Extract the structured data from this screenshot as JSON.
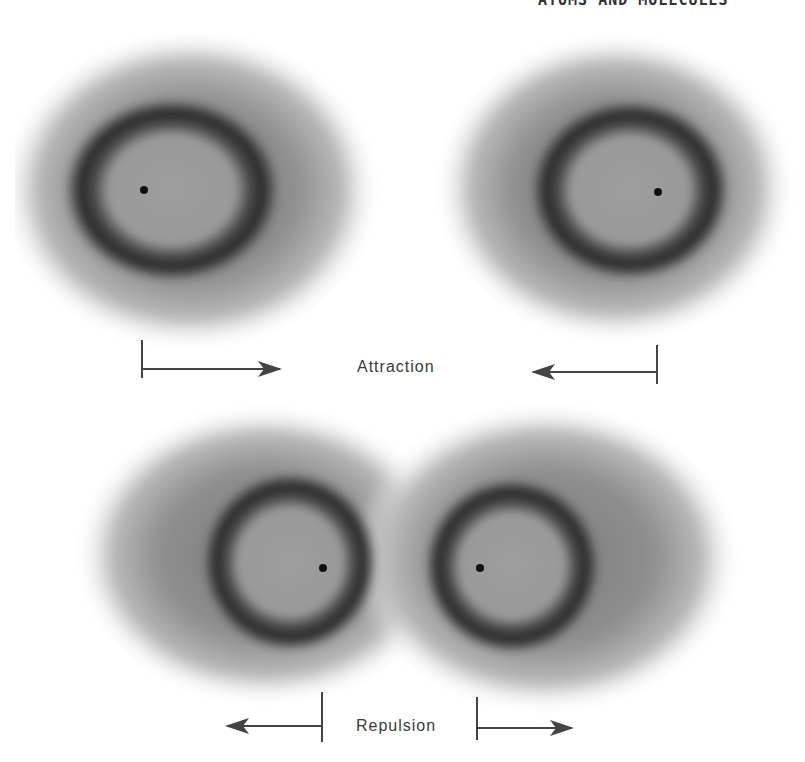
{
  "header": {
    "running_title": "ATOMS AND MOLECULES"
  },
  "panels": {
    "attraction": {
      "label": "Attraction",
      "atoms": [
        {
          "name": "left-atom",
          "ring_center": [
            172,
            190
          ],
          "nucleus": [
            144,
            190
          ]
        },
        {
          "name": "right-atom",
          "ring_center": [
            630,
            190
          ],
          "nucleus": [
            658,
            192
          ]
        }
      ],
      "arrows": [
        {
          "name": "arrow-right",
          "bar_x": 142,
          "from_x": 142,
          "to_x": 280,
          "y": 369,
          "direction": "right"
        },
        {
          "name": "arrow-left",
          "bar_x": 657,
          "from_x": 657,
          "to_x": 532,
          "y": 372,
          "direction": "left"
        }
      ]
    },
    "repulsion": {
      "label": "Repulsion",
      "atoms": [
        {
          "name": "left-atom",
          "ring_center": [
            290,
            560
          ],
          "nucleus": [
            323,
            568
          ]
        },
        {
          "name": "right-atom",
          "ring_center": [
            512,
            565
          ],
          "nucleus": [
            480,
            568
          ]
        }
      ],
      "arrows": [
        {
          "name": "arrow-left",
          "bar_x": 322,
          "from_x": 322,
          "to_x": 226,
          "y": 726,
          "direction": "left"
        },
        {
          "name": "arrow-right",
          "bar_x": 477,
          "from_x": 477,
          "to_x": 573,
          "y": 728,
          "direction": "right"
        }
      ]
    }
  },
  "colors": {
    "halo": "#8a8a8a",
    "ring": "#2e2e2e",
    "inner": "#9c9c9c",
    "nucleus": "#111111",
    "arrow": "#444444"
  }
}
